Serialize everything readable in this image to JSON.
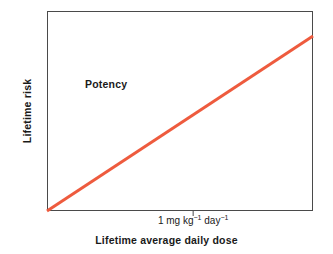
{
  "figure": {
    "background_color": "#ffffff",
    "width": 333,
    "height": 254
  },
  "axes": {
    "frame_color": "#4a4a4a",
    "x_title": "Lifetime average daily dose",
    "y_title": "Lifetime risk",
    "x_tick_label_prefix": "1 mg kg",
    "x_tick_exponent_1": "−1",
    "x_tick_label_middle": " day",
    "x_tick_exponent_2": "−1",
    "x_tick_label_full": "1 mg kg⁻¹ day⁻¹"
  },
  "annotations": {
    "potency": "Potency"
  },
  "chart_data": {
    "type": "line",
    "title": "",
    "subtitle": "",
    "xlabel": "Lifetime average daily dose",
    "ylabel": "Lifetime risk",
    "grid": false,
    "legend": false,
    "xlim": [
      0,
      1.82
    ],
    "ylim": [
      0,
      1
    ],
    "x_ticks": [
      1
    ],
    "x_tick_labels": [
      "1 mg kg⁻¹ day⁻¹"
    ],
    "y_ticks": [],
    "y_tick_labels": [],
    "annotations": [
      {
        "text": "Potency",
        "x": 0.26,
        "y": 0.625,
        "bold": true,
        "note": "label identifying the slope of the dose-response line"
      }
    ],
    "series": [
      {
        "name": "Potency (dose-response slope)",
        "color": "#ee5b3e",
        "line_width": 3,
        "x": [
          0,
          1.82
        ],
        "y": [
          0,
          0.875
        ],
        "points": [
          {
            "x": 0,
            "y": 0
          },
          {
            "x": 1.0,
            "y": 0.481
          },
          {
            "x": 1.82,
            "y": 0.875
          }
        ],
        "slope": 0.481,
        "intercept": 0
      }
    ]
  }
}
